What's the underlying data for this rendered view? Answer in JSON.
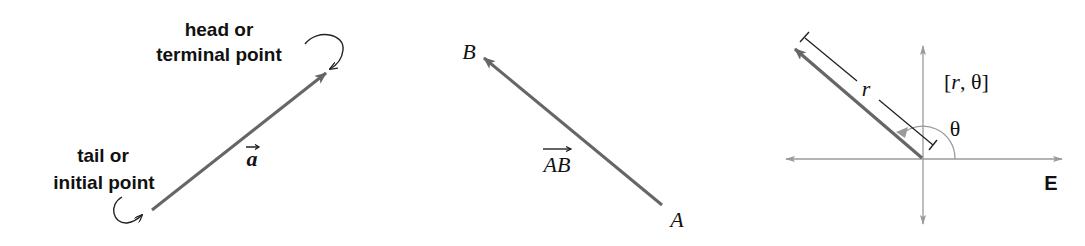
{
  "colors": {
    "vector": "#666666",
    "axis": "#9a9a9a",
    "text": "#111111",
    "annotation": "#222222",
    "background": "#ffffff"
  },
  "panels": [
    {
      "id": "vector-parts",
      "vector_label": "a",
      "head_label": {
        "line1": "head or",
        "line2": "terminal point"
      },
      "tail_label": {
        "line1": "tail or",
        "line2": "initial point"
      }
    },
    {
      "id": "vector-AB",
      "vector_label": "AB",
      "start_point": "A",
      "end_point": "B"
    },
    {
      "id": "polar-vector",
      "magnitude_label": "r",
      "angle_label": "θ",
      "coordinate_label": "[r, θ]",
      "coord_open": "[",
      "coord_r": "r",
      "coord_sep": ", θ]",
      "axis_label": "E"
    }
  ]
}
